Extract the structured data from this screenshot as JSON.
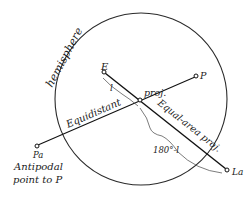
{
  "diagram": {
    "type": "geometric projection diagram",
    "circle": {
      "label": "hemisphere",
      "cx": 141,
      "cy": 99,
      "r": 86
    },
    "points": {
      "E": {
        "label": "E",
        "x": 104,
        "y": 72
      },
      "center": {
        "label": "",
        "x": 140,
        "y": 100
      },
      "P": {
        "label": "P",
        "x": 197,
        "y": 76
      },
      "Pa": {
        "label": "Pa",
        "x": 36,
        "y": 146
      },
      "La": {
        "label": "La",
        "x": 228,
        "y": 171
      }
    },
    "labels": {
      "hemisphere": "hemisphere",
      "E": "E",
      "l": "l",
      "proj": "proj.",
      "P": "P",
      "equidistant": "Equidistant",
      "equal_area": "Equal-area proj.",
      "complement": "180°-l",
      "Pa": "Pa",
      "antipodal_line1": "Antipodal",
      "antipodal_line2": "point to P",
      "La": "La"
    }
  }
}
